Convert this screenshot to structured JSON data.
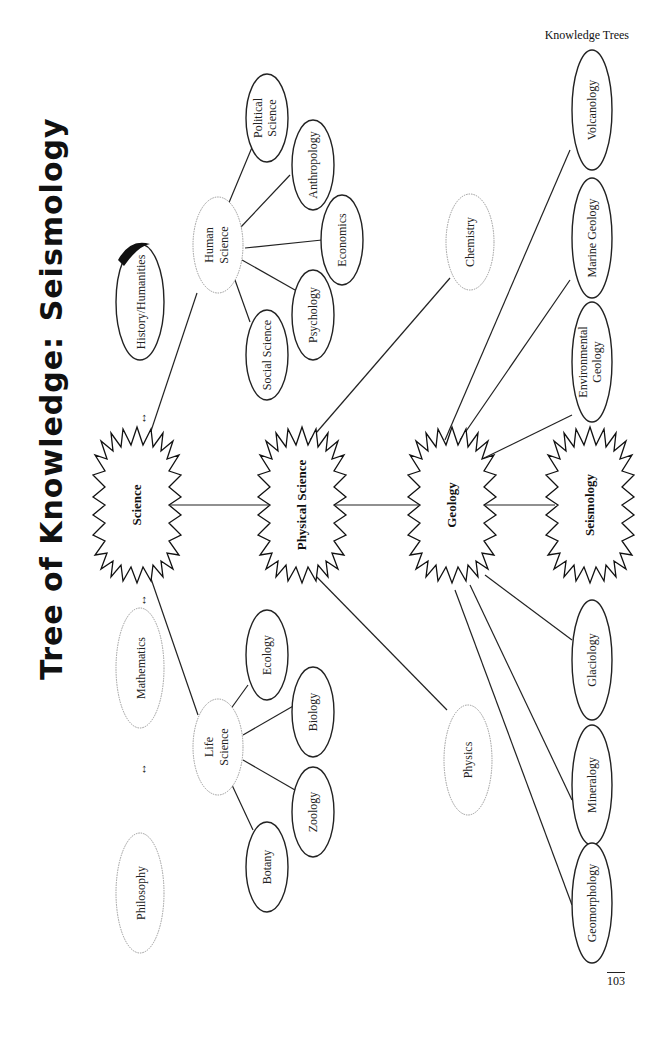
{
  "page": {
    "running_header": "Knowledge Trees",
    "page_number": "103"
  },
  "title": {
    "prefix": "Tree of Knowledge:",
    "subject": "Seismology"
  },
  "orientation": "rotated 90° counter-clockwise (text reads bottom-to-top)",
  "disciplines": {
    "philosophy": "Philosophy",
    "mathematics": "Mathematics",
    "history_humanities": "History/Humanities",
    "arrow_symbol": "↔"
  },
  "main_chain": [
    "Science",
    "Physical Science",
    "Geology",
    "Seismology"
  ],
  "branches": {
    "life_science": {
      "label_line1": "Life",
      "label_line2": "Science",
      "children": [
        "Botany",
        "Zoology",
        "Biology",
        "Ecology"
      ]
    },
    "human_science": {
      "label_line1": "Human",
      "label_line2": "Science",
      "children": [
        "Social Science",
        "Psychology",
        "Economics",
        "Anthropology"
      ],
      "political_line1": "Political",
      "political_line2": "Science"
    },
    "physical_science_children": [
      "Physics",
      "Chemistry"
    ],
    "geology_children": {
      "geomorphology": "Geomorphology",
      "mineralogy": "Mineralogy",
      "glaciology": "Glaciology",
      "environmental_line1": "Environmental",
      "environmental_line2": "Geology",
      "marine_geology": "Marine Geology",
      "volcanology": "Volcanology"
    }
  }
}
